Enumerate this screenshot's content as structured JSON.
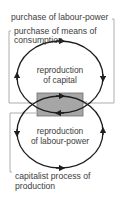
{
  "diagram": {
    "labels": {
      "labour_power": "purchase of labour-power",
      "means_line1": "purchase of means of",
      "means_line2": "consumption",
      "capital_line1": "reproduction",
      "capital_line2": "of capital",
      "labour_line1": "reproduction",
      "labour_line2": "of labour-power",
      "production_line1": "capitalist process of",
      "production_line2": "production"
    },
    "colors": {
      "loop_stroke": "#1e1e1e",
      "bracket_stroke": "#9a9a9a",
      "box_fill": "#a6a6a6",
      "box_stroke": "#6e6e6e",
      "text": "#3c3c3c"
    }
  }
}
